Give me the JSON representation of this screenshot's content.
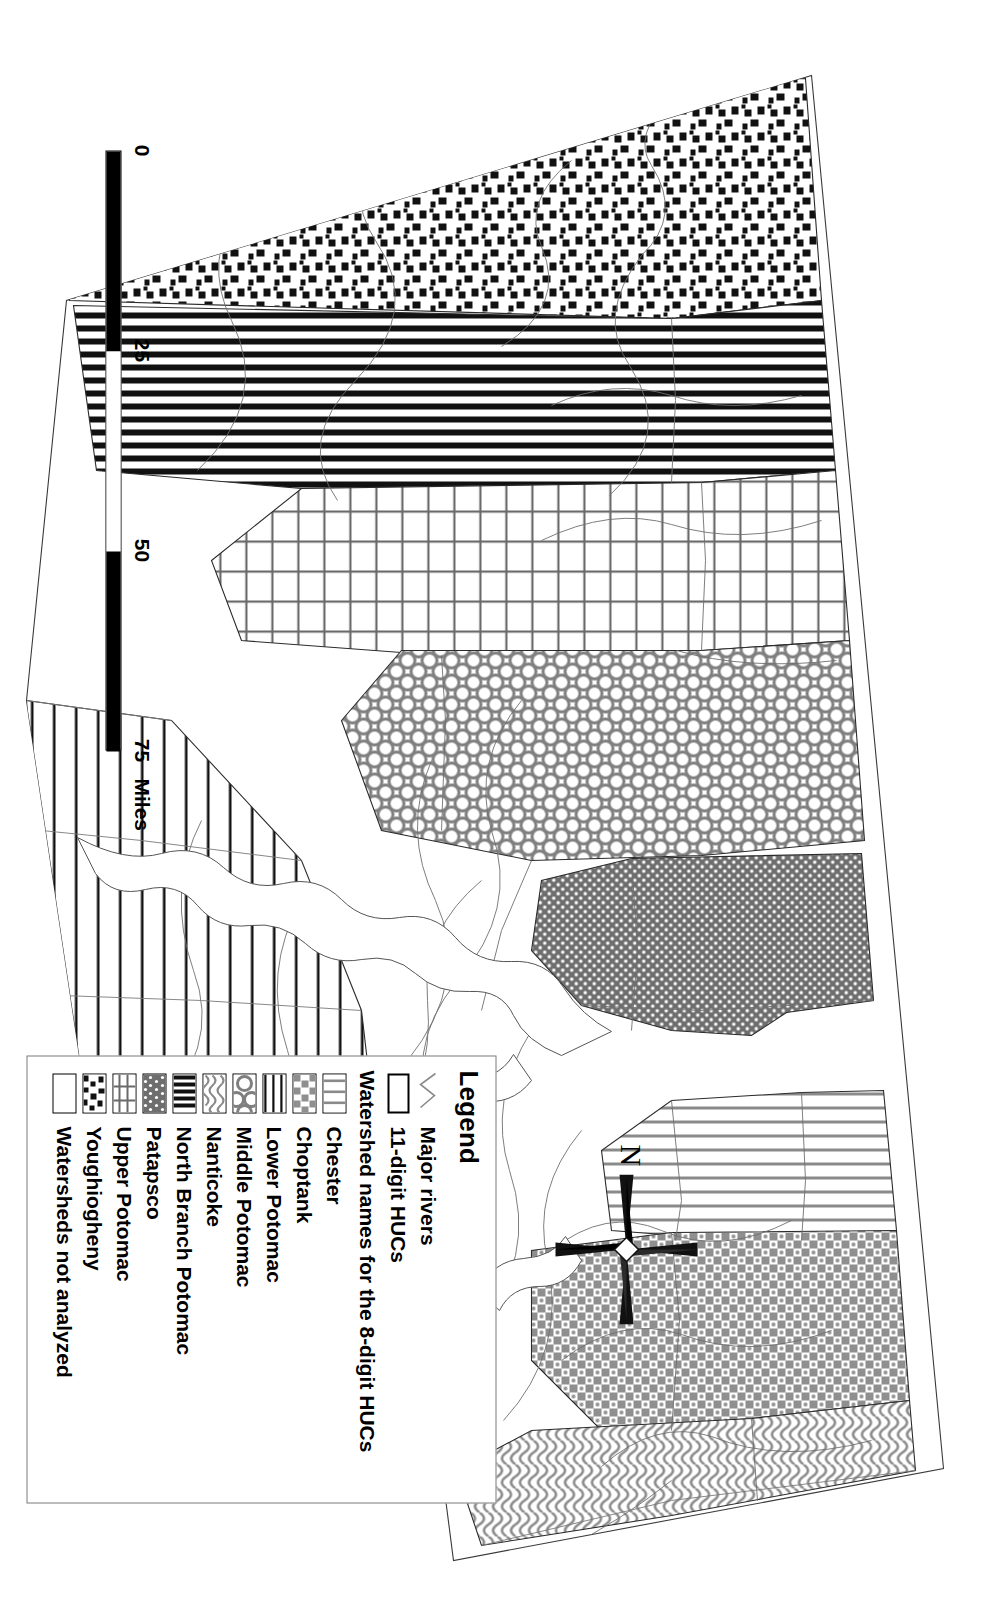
{
  "figure": {
    "type": "thematic-watershed-map",
    "orientation": "rotated-90-clockwise",
    "region": "Maryland — Chesapeake Bay watersheds"
  },
  "legend": {
    "title": "Legend",
    "line_items": [
      {
        "key": "major-rivers-line",
        "label": "Major rivers"
      },
      {
        "key": "huc11-outline",
        "label": "11-digit HUCs"
      }
    ],
    "subhead": "Watershed names for the 8-digit HUCs",
    "watersheds": [
      {
        "label": "Chester",
        "pattern": "vertical-thin-lines"
      },
      {
        "label": "Choptank",
        "pattern": "coarse-mottled-checker"
      },
      {
        "label": "Lower Potomac",
        "pattern": "horizontal-thick-lines"
      },
      {
        "label": "Middle Potomac",
        "pattern": "circles-net"
      },
      {
        "label": "Nanticoke",
        "pattern": "wavy-squiggles"
      },
      {
        "label": "North Branch Potomac",
        "pattern": "vertical-heavy-bars"
      },
      {
        "label": "Patapsco",
        "pattern": "dense-dots"
      },
      {
        "label": "Upper Potomac",
        "pattern": "rectangular-grid"
      },
      {
        "label": "Youghiogheny",
        "pattern": "scattered-blocks"
      },
      {
        "label": "Watersheds not analyzed",
        "pattern": "blank-white"
      }
    ]
  },
  "scale_bar": {
    "ticks": [
      "0",
      "25",
      "50",
      "75"
    ],
    "unit": "Miles",
    "segments": 3
  },
  "north_arrow": {
    "label": "N",
    "style": "four-point-star"
  },
  "colors": {
    "ink": "#000000",
    "paper": "#ffffff",
    "hairline": "#7a7a7a",
    "pattern_gray": "#6e6e6e"
  }
}
